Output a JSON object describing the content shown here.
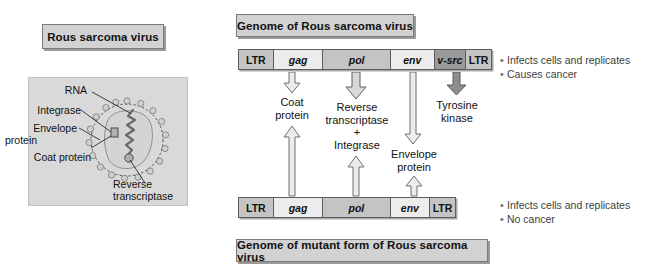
{
  "figure": {
    "left_panel": {
      "title": "Rous sarcoma virus",
      "virion_labels": {
        "rna": "RNA",
        "integrase": "Integrase",
        "envelope_protein_line1": "Envelope",
        "envelope_protein_line2": "protein",
        "coat_protein": "Coat protein",
        "reverse_transcriptase_line1": "Reverse",
        "reverse_transcriptase_line2": "transcriptase"
      }
    },
    "top": {
      "title": "Genome of Rous sarcoma virus",
      "genome_segments": [
        {
          "label": "LTR",
          "kind": "ltr",
          "shade": "sh-mid",
          "width_pct": 13.8
        },
        {
          "label": "gag",
          "kind": "gene",
          "shade": "sh-light",
          "width_pct": 19.7
        },
        {
          "label": "pol",
          "kind": "gene",
          "shade": "sh-mid",
          "width_pct": 26.8
        },
        {
          "label": "env",
          "kind": "gene",
          "shade": "sh-light",
          "width_pct": 17.3
        },
        {
          "label": "v-src",
          "kind": "gene",
          "shade": "sh-dark",
          "width_pct": 12.6
        },
        {
          "label": "LTR",
          "kind": "ltr",
          "shade": "sh-mid",
          "width_pct": 9.8
        }
      ],
      "bullets": [
        "Infects cells and replicates",
        "Causes cancer"
      ]
    },
    "bottom": {
      "title": "Genome of mutant form of Rous sarcoma virus",
      "genome_segments": [
        {
          "label": "LTR",
          "kind": "ltr",
          "shade": "sh-mid",
          "width_pct": 16.1
        },
        {
          "label": "gag",
          "kind": "gene",
          "shade": "sh-light",
          "width_pct": 22.9
        },
        {
          "label": "pol",
          "kind": "gene",
          "shade": "sh-mid",
          "width_pct": 31.2
        },
        {
          "label": "env",
          "kind": "gene",
          "shade": "sh-light",
          "width_pct": 18.3
        },
        {
          "label": "LTR",
          "kind": "ltr",
          "shade": "sh-mid",
          "width_pct": 11.5
        }
      ],
      "bullets": [
        "Infects cells and replicates",
        "No cancer"
      ]
    },
    "products": {
      "coat": {
        "line1": "Coat",
        "line2": "protein"
      },
      "pol": {
        "line1": "Reverse",
        "line2": "transcriptase",
        "line3": "+",
        "line4": "Integrase"
      },
      "env": {
        "line1": "Envelope",
        "line2": "protein"
      },
      "src": {
        "line1": "Tyrosine",
        "line2": "kinase"
      }
    },
    "colors": {
      "plaque_fill": "#d2d2d2",
      "plaque_border": "#7a7a7a",
      "segment_light": "#ececec",
      "segment_mid": "#c4c4c4",
      "segment_dark": "#9a9a9a",
      "panel_bg": "#d9d9d9",
      "arrow_fill": "#e8e8e8",
      "arrow_stroke": "#6e6e6e",
      "arrow_dark_fill": "#8e8e8e",
      "bullet_text": "#3d3d3d"
    }
  }
}
